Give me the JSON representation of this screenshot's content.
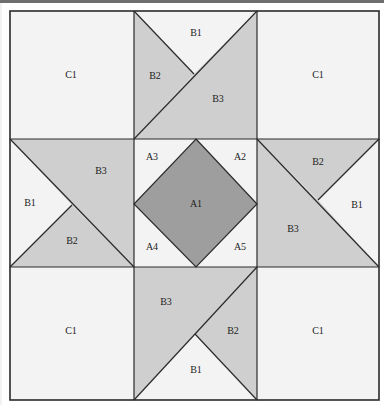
{
  "colors": {
    "background": "#ffffff",
    "light_fabric": "#f3f3f3",
    "medium_fabric": "#cfcfcf",
    "dark_fabric": "#9e9e9e",
    "outline": "#2a2a2a",
    "top_bar": "#6e6e6e"
  },
  "diagram": {
    "type": "quilt-block-piecing-diagram",
    "grid": "3x3",
    "cells": {
      "top_left": {
        "label": "C1",
        "fill": "light"
      },
      "top_center": {
        "pieces": [
          {
            "label": "B1",
            "fill": "light"
          },
          {
            "label": "B2",
            "fill": "medium"
          },
          {
            "label": "B3",
            "fill": "medium"
          }
        ]
      },
      "top_right": {
        "label": "C1",
        "fill": "light"
      },
      "middle_left": {
        "pieces": [
          {
            "label": "B1",
            "fill": "light"
          },
          {
            "label": "B2",
            "fill": "medium"
          },
          {
            "label": "B3",
            "fill": "medium"
          }
        ]
      },
      "center": {
        "pieces": [
          {
            "label": "A1",
            "fill": "dark"
          },
          {
            "label": "A2",
            "fill": "light"
          },
          {
            "label": "A3",
            "fill": "light"
          },
          {
            "label": "A4",
            "fill": "light"
          },
          {
            "label": "A5",
            "fill": "light"
          }
        ]
      },
      "middle_right": {
        "pieces": [
          {
            "label": "B1",
            "fill": "light"
          },
          {
            "label": "B2",
            "fill": "medium"
          },
          {
            "label": "B3",
            "fill": "medium"
          }
        ]
      },
      "bottom_left": {
        "label": "C1",
        "fill": "light"
      },
      "bottom_center": {
        "pieces": [
          {
            "label": "B1",
            "fill": "light"
          },
          {
            "label": "B2",
            "fill": "medium"
          },
          {
            "label": "B3",
            "fill": "medium"
          }
        ]
      },
      "bottom_right": {
        "label": "C1",
        "fill": "light"
      }
    }
  }
}
